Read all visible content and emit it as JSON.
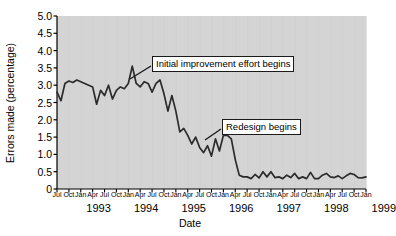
{
  "chart_data": {
    "type": "line",
    "title": "",
    "xlabel": "Date",
    "ylabel": "Errors made (percentage)",
    "ylim": [
      0,
      5.0
    ],
    "yticks": [
      "0",
      "0.5",
      "1.0",
      "1.5",
      "2.0",
      "2.5",
      "3.0",
      "3.5",
      "4.0",
      "4.5",
      "5.0"
    ],
    "ytick_values": [
      0,
      0.5,
      1.0,
      1.5,
      2.0,
      2.5,
      3.0,
      3.5,
      4.0,
      4.5,
      5.0
    ],
    "grid": false,
    "legend": "none",
    "plot_background": "#d4d4d4",
    "line_color": "#2b2b2b",
    "xtick_labels": [
      "Jul",
      "Oct",
      "Jan",
      "Apr",
      "Jul",
      "Oct",
      "Jan",
      "Apr",
      "Jul",
      "Oct",
      "Jan",
      "Apr",
      "Jul",
      "Oct",
      "Jan",
      "Apr",
      "Jul",
      "Oct",
      "Jan",
      "Apr",
      "Jul",
      "Oct",
      "Jan",
      "Apr",
      "Jul",
      "Oct",
      "Jan"
    ],
    "year_labels": [
      "1993",
      "1994",
      "1995",
      "1996",
      "1997",
      "1998",
      "1999"
    ],
    "x": [
      "Jul 1993",
      "Aug 1993",
      "Sep 1993",
      "Oct 1993",
      "Nov 1993",
      "Dec 1993",
      "Jan 1994",
      "Feb 1994",
      "Mar 1994",
      "Apr 1994",
      "May 1994",
      "Jun 1994",
      "Jul 1994",
      "Aug 1994",
      "Sep 1994",
      "Oct 1994",
      "Nov 1994",
      "Dec 1994",
      "Jan 1995",
      "Feb 1995",
      "Mar 1995",
      "Apr 1995",
      "May 1995",
      "Jun 1995",
      "Jul 1995",
      "Aug 1995",
      "Sep 1995",
      "Oct 1995",
      "Nov 1995",
      "Dec 1995",
      "Jan 1996",
      "Feb 1996",
      "Mar 1996",
      "Apr 1996",
      "May 1996",
      "Jun 1996",
      "Jul 1996",
      "Aug 1996",
      "Sep 1996",
      "Oct 1996",
      "Nov 1996",
      "Dec 1996",
      "Jan 1997",
      "Feb 1997",
      "Mar 1997",
      "Apr 1997",
      "May 1997",
      "Jun 1997",
      "Jul 1997",
      "Aug 1997",
      "Sep 1997",
      "Oct 1997",
      "Nov 1997",
      "Dec 1997",
      "Jan 1998",
      "Feb 1998",
      "Mar 1998",
      "Apr 1998",
      "May 1998",
      "Jun 1998",
      "Jul 1998",
      "Aug 1998",
      "Sep 1998",
      "Oct 1998",
      "Nov 1998",
      "Dec 1998",
      "Jan 1999",
      "Feb 1999",
      "Mar 1999",
      "Apr 1999",
      "May 1999",
      "Jun 1999",
      "Jul 1999",
      "Aug 1999",
      "Sep 1999",
      "Oct 1999",
      "Nov 1999",
      "Dec 1999",
      "Jan 2000"
    ],
    "values": [
      2.8,
      2.55,
      3.05,
      3.12,
      3.08,
      3.15,
      3.1,
      3.05,
      3.0,
      2.95,
      2.45,
      2.85,
      2.7,
      3.0,
      2.6,
      2.85,
      2.95,
      2.9,
      3.05,
      3.55,
      3.05,
      2.95,
      3.1,
      3.05,
      2.8,
      3.05,
      3.15,
      2.75,
      2.25,
      2.7,
      2.25,
      1.65,
      1.75,
      1.55,
      1.3,
      1.5,
      1.2,
      1.05,
      1.25,
      0.95,
      1.45,
      1.1,
      1.55,
      1.55,
      1.45,
      0.85,
      0.4,
      0.35,
      0.35,
      0.3,
      0.42,
      0.32,
      0.5,
      0.35,
      0.5,
      0.33,
      0.35,
      0.3,
      0.4,
      0.33,
      0.45,
      0.3,
      0.35,
      0.3,
      0.48,
      0.3,
      0.3,
      0.4,
      0.45,
      0.35,
      0.33,
      0.38,
      0.3,
      0.38,
      0.45,
      0.42,
      0.33,
      0.32,
      0.35
    ]
  },
  "annotations": [
    {
      "id": "initial-improvement",
      "text": "Initial improvement effort begins"
    },
    {
      "id": "redesign",
      "text": "Redesign begins"
    }
  ]
}
